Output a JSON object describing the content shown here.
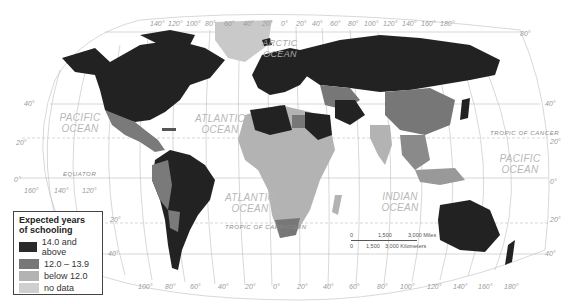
{
  "map": {
    "legend": {
      "title_line1": "Expected years",
      "title_line2": "of schooling",
      "items": [
        {
          "label": "14.0 and above",
          "color": "#2a2a2a"
        },
        {
          "label": "12.0 – 13.9",
          "color": "#777777"
        },
        {
          "label": "below 12.0",
          "color": "#b3b3b3"
        },
        {
          "label": "no data",
          "color": "#cfcfcf"
        }
      ]
    },
    "oceans": {
      "pacific_west_1": "PACIFIC",
      "pacific_west_2": "OCEAN",
      "atlantic_north_1": "ATLANTIC",
      "atlantic_north_2": "OCEAN",
      "arctic_1": "ARCTIC",
      "arctic_2": "OCEAN",
      "atlantic_south_1": "ATLANTIC",
      "atlantic_south_2": "OCEAN",
      "indian_1": "INDIAN",
      "indian_2": "OCEAN",
      "pacific_east_1": "PACIFIC",
      "pacific_east_2": "OCEAN"
    },
    "lines": {
      "tropic_cancer": "TROPIC OF CANCER",
      "tropic_capricorn": "TROPIC OF CAPRICORN",
      "equator": "EQUATOR"
    },
    "top_longitudes": [
      "140°",
      "120°",
      "100°",
      "80°",
      "60°",
      "40°",
      "20°",
      "0°",
      "20°",
      "40°",
      "60°",
      "80°",
      "100°",
      "120°",
      "140°",
      "160°",
      "180°"
    ],
    "bottom_longitudes": [
      "100°",
      "80°",
      "60°",
      "40°",
      "20°",
      "0°",
      "20°",
      "40°",
      "60°",
      "80°",
      "100°",
      "120°",
      "140°",
      "160°",
      "180°"
    ],
    "left_latitudes": [
      "40°",
      "20°",
      "0°",
      "20°",
      "40°"
    ],
    "right_latitudes": [
      "80°",
      "40°",
      "20°",
      "0°",
      "20°",
      "40°"
    ],
    "pacific_longitudes": [
      "160°",
      "140°",
      "120°"
    ],
    "scale": {
      "miles_0": "0",
      "miles_1500": "1,500",
      "miles_3000": "3,000 Miles",
      "km_0": "0",
      "km_1500": "1,500",
      "km_3000": "3,000 Kilometers"
    }
  }
}
